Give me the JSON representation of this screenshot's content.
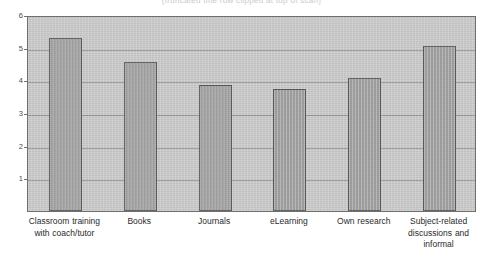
{
  "figure": {
    "clipped_title": "(truncated title row clipped at top of scan)"
  },
  "chart_data": {
    "type": "bar",
    "title": "",
    "xlabel": "",
    "ylabel": "",
    "ylim": [
      0,
      6
    ],
    "yticks": [
      0,
      1,
      2,
      3,
      4,
      5,
      6
    ],
    "ytick_labels": [
      "0",
      "1",
      "2",
      "3",
      "4",
      "5",
      "6"
    ],
    "grid": true,
    "legend": "none",
    "bar_color": "#a8a8a8",
    "bar_edge_color": "#555555",
    "plot_background": "#cccccc",
    "categories": [
      "Classroom training with coach/tutor",
      "Books",
      "Journals",
      "eLearning",
      "Own research",
      "Subject-related discussions and informal"
    ],
    "values": [
      5.3,
      4.55,
      3.85,
      3.72,
      4.08,
      5.05
    ]
  },
  "axis": {
    "y": {
      "ticks": [
        {
          "label": "6",
          "value": 6
        },
        {
          "label": "5",
          "value": 5
        },
        {
          "label": "4",
          "value": 4
        },
        {
          "label": "3",
          "value": 3
        },
        {
          "label": "2",
          "value": 2
        },
        {
          "label": "1",
          "value": 1
        },
        {
          "label": "0",
          "value": 0
        }
      ]
    }
  }
}
